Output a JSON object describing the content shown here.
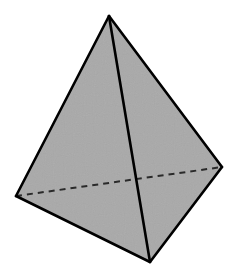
{
  "diagram": {
    "type": "tetrahedron",
    "background": "#ffffff",
    "fill_color": "#a9a9a9",
    "stroke_color": "#000000",
    "hidden_edge_color": "#2a2a2a",
    "vertices": {
      "apex": {
        "x": 109,
        "y": 16
      },
      "left": {
        "x": 16,
        "y": 196
      },
      "right": {
        "x": 222,
        "y": 167
      },
      "bottom": {
        "x": 150,
        "y": 262
      }
    },
    "visible_edges": [
      [
        "apex",
        "left"
      ],
      [
        "apex",
        "right"
      ],
      [
        "apex",
        "bottom"
      ],
      [
        "left",
        "bottom"
      ],
      [
        "right",
        "bottom"
      ]
    ],
    "hidden_edges": [
      [
        "left",
        "right"
      ]
    ]
  }
}
